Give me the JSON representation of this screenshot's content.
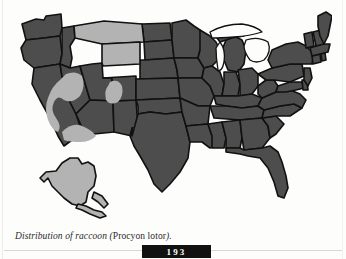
{
  "page": {
    "folio": "193",
    "background_color": "#fdfdfc"
  },
  "figure": {
    "caption_prefix": "Distribution of raccoon (",
    "caption_species": "Procyon lotor",
    "caption_suffix": ").",
    "caption_full": "Distribution of raccoon (Procyon lotor).",
    "map_title": "Distribution of raccoon (Procyon lotor)"
  },
  "legend": {
    "present_label": "Range of raccoon (shaded dark)",
    "absent_label": "Outside range (shaded light)",
    "present_color": "#4d4d4d",
    "absent_color": "#b3b3b3",
    "border_color": "#111111",
    "water_color": "#fdfdfc"
  },
  "map_data": {
    "type": "choropleth",
    "region": "United States",
    "categories": [
      "present",
      "absent"
    ],
    "states_present": [
      "Washington",
      "Oregon",
      "Idaho",
      "California",
      "Nevada",
      "Utah",
      "Arizona",
      "New Mexico",
      "Colorado",
      "North Dakota",
      "South Dakota",
      "Nebraska",
      "Kansas",
      "Oklahoma",
      "Texas",
      "Minnesota",
      "Iowa",
      "Missouri",
      "Arkansas",
      "Louisiana",
      "Wisconsin",
      "Illinois",
      "Michigan",
      "Indiana",
      "Ohio",
      "Kentucky",
      "Tennessee",
      "Mississippi",
      "Alabama",
      "Georgia",
      "Florida",
      "South Carolina",
      "North Carolina",
      "Virginia",
      "West Virginia",
      "Maryland",
      "Delaware",
      "Pennsylvania",
      "New Jersey",
      "New York",
      "Connecticut",
      "Rhode Island",
      "Massachusetts",
      "Vermont",
      "New Hampshire",
      "Maine"
    ],
    "states_absent": [
      "Montana",
      "Wyoming",
      "Alaska"
    ],
    "absent_subregions": [
      "Great Basin (eastern California / Nevada)",
      "Mojave and Sonoran desert (southern California / western Arizona)",
      "Colorado Plateau (eastern Utah / western Colorado)"
    ],
    "insets": [
      "Alaska"
    ],
    "water_features": [
      "Great Lakes"
    ]
  }
}
